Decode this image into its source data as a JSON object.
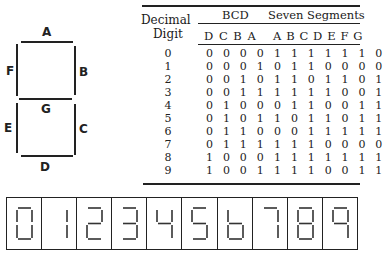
{
  "segment_diagram": {
    "labels": {
      "A": "A",
      "B": "B",
      "C": "C",
      "D": "D",
      "E": "E",
      "F": "F",
      "G": "G"
    }
  },
  "table": {
    "headers": {
      "decimal_line1": "Decimal",
      "decimal_line2": "Digit",
      "bcd": "BCD",
      "seven_segments": "Seven Segments",
      "bcd_bits": "D C B A",
      "segment_bits": "A B C D E F G"
    },
    "rows": [
      {
        "digit": "0",
        "bcd": "0 0 0 0",
        "segments": "1 1 1 1 1 1 0"
      },
      {
        "digit": "1",
        "bcd": "0 0 0 1",
        "segments": "0 1 1 0 0 0 0"
      },
      {
        "digit": "2",
        "bcd": "0 0 1 0",
        "segments": "1 1 0 1 1 0 1"
      },
      {
        "digit": "3",
        "bcd": "0 0 1 1",
        "segments": "1 1 1 1 0 0 1"
      },
      {
        "digit": "4",
        "bcd": "0 1 0 0",
        "segments": "0 1 1 0 0 1 1"
      },
      {
        "digit": "5",
        "bcd": "0 1 0 1",
        "segments": "1 0 1 1 0 1 1"
      },
      {
        "digit": "6",
        "bcd": "0 1 1 0",
        "segments": "0 0 1 1 1 1 1"
      },
      {
        "digit": "7",
        "bcd": "0 1 1 1",
        "segments": "1 1 1 0 0 0 0"
      },
      {
        "digit": "8",
        "bcd": "1 0 0 0",
        "segments": "1 1 1 1 1 1 1"
      },
      {
        "digit": "9",
        "bcd": "1 0 0 1",
        "segments": "1 1 1 0 0 1 1"
      }
    ]
  },
  "display": {
    "digits": [
      "0",
      "1",
      "2",
      "3",
      "4",
      "5",
      "6",
      "7",
      "8",
      "9"
    ],
    "segment_patterns": {
      "0": "1111110",
      "1": "0110000",
      "2": "1101101",
      "3": "1111001",
      "4": "0110011",
      "5": "1011011",
      "6": "0011111",
      "7": "1110000",
      "8": "1111111",
      "9": "1110011"
    }
  }
}
